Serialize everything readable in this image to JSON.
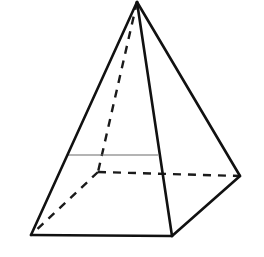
{
  "figure": {
    "name": "square-pyramid",
    "canvas": {
      "width": 264,
      "height": 257,
      "background": "#ffffff"
    },
    "style": {
      "visible_edge_color": "#111111",
      "visible_edge_width": 2.6,
      "hidden_edge_color": "#1a1a1a",
      "hidden_edge_width": 2.4,
      "hidden_dash_pattern": "8,7",
      "cross_section_color": "#6a6a6a",
      "cross_section_width": 1.2,
      "face_fill": "#ffffff"
    },
    "vertices": {
      "apex": {
        "label": "apex",
        "x": 137,
        "y": 2,
        "hidden": false
      },
      "base_front_left": {
        "label": "base-front-left",
        "x": 31,
        "y": 235,
        "hidden": false
      },
      "base_front_right": {
        "label": "base-front-right",
        "x": 172,
        "y": 236,
        "hidden": false
      },
      "base_right": {
        "label": "base-right",
        "x": 240,
        "y": 176,
        "hidden": false
      },
      "base_back": {
        "label": "base-back",
        "x": 98,
        "y": 172,
        "hidden": true
      }
    },
    "edges_solid": [
      {
        "name": "edge-apex-to-front-left",
        "from": "apex",
        "to": "base_front_left",
        "d": "M 137 2 L 31 235"
      },
      {
        "name": "edge-apex-to-front-right",
        "from": "apex",
        "to": "base_front_right",
        "d": "M 137 2 L 172 236"
      },
      {
        "name": "edge-apex-to-right",
        "from": "apex",
        "to": "base_right",
        "d": "M 137 2 L 240 176"
      },
      {
        "name": "edge-base-front",
        "from": "base_front_left",
        "to": "base_front_right",
        "d": "M 31 235 L 172 236"
      },
      {
        "name": "edge-base-front-right-to-right",
        "from": "base_front_right",
        "to": "base_right",
        "d": "M 172 236 L 240 176"
      }
    ],
    "edges_hidden": [
      {
        "name": "hidden-edge-apex-to-back",
        "from": "apex",
        "to": "base_back",
        "d": "M 137 2 L 98 172"
      },
      {
        "name": "hidden-edge-back-to-front-left",
        "from": "base_back",
        "to": "base_front_left",
        "d": "M 98 172 L 31 235"
      },
      {
        "name": "hidden-edge-back-to-right",
        "from": "base_back",
        "to": "base_right",
        "d": "M 98 172 L 240 176"
      }
    ],
    "cross_section": {
      "name": "cross-section-line",
      "d": "M 67 155 L 158 155",
      "x1": 67,
      "y1": 155,
      "x2": 158,
      "y2": 155
    },
    "faces": [
      {
        "name": "face-front-left",
        "d": "M 137 2 L 31 235 L 172 236 Z"
      },
      {
        "name": "face-front-right",
        "d": "M 137 2 L 172 236 L 240 176 Z"
      }
    ]
  }
}
